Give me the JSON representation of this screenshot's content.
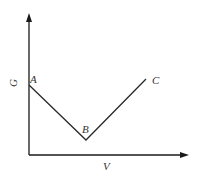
{
  "diagram": {
    "axes": {
      "y_label": "G",
      "x_label": "V"
    },
    "points": [
      {
        "label": "A",
        "x": 29,
        "y": 85
      },
      {
        "label": "B",
        "x": 86,
        "y": 140
      },
      {
        "label": "C",
        "x": 146,
        "y": 79
      }
    ],
    "colors": {
      "line": "#2a2a2a",
      "axis": "#1a1a1a",
      "background": "#ffffff"
    }
  }
}
